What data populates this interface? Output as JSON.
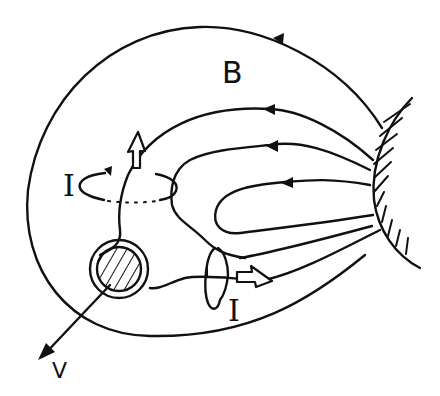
{
  "diagram": {
    "type": "physics-sketch",
    "labels": {
      "field": "B",
      "current_upper": "I",
      "current_lower": "I",
      "velocity": "V"
    },
    "elements": [
      {
        "name": "outer-field-line",
        "arrow": "leftward"
      },
      {
        "name": "field-line-2",
        "arrow": "leftward"
      },
      {
        "name": "field-line-3",
        "arrow": "leftward"
      },
      {
        "name": "field-line-4",
        "arrow": "leftward"
      },
      {
        "name": "hatched-wall",
        "side": "right"
      },
      {
        "name": "hatched-body",
        "shape": "circle"
      },
      {
        "name": "current-loop-upper",
        "orientation": "horizontal"
      },
      {
        "name": "current-loop-lower",
        "orientation": "vertical"
      },
      {
        "name": "hollow-arrow-up"
      },
      {
        "name": "hollow-arrow-right"
      },
      {
        "name": "velocity-vector",
        "direction": "down-left"
      }
    ],
    "colors": {
      "ink": "#111111",
      "background": "#ffffff"
    }
  }
}
